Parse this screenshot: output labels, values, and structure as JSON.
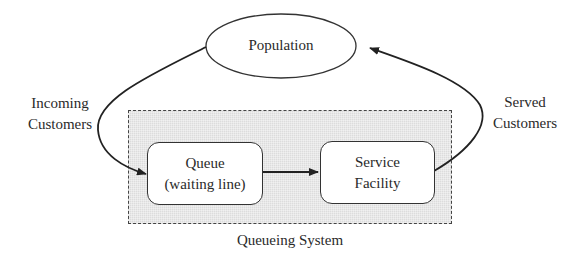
{
  "diagram": {
    "type": "flow",
    "nodes": {
      "population": {
        "label": "Population",
        "shape": "ellipse"
      },
      "queue": {
        "line1": "Queue",
        "line2": "(waiting line)",
        "shape": "rounded-rect"
      },
      "service": {
        "line1": "Service",
        "line2": "Facility",
        "shape": "rounded-rect"
      }
    },
    "group": {
      "label": "Queueing System",
      "style": "dashed shaded rectangle"
    },
    "edge_labels": {
      "incoming": {
        "line1": "Incoming",
        "line2": "Customers"
      },
      "served": {
        "line1": "Served",
        "line2": "Customers"
      }
    },
    "edges": [
      {
        "from": "population",
        "to": "queue",
        "label": "Incoming Customers"
      },
      {
        "from": "queue",
        "to": "service"
      },
      {
        "from": "service",
        "to": "population",
        "label": "Served Customers"
      }
    ],
    "colors": {
      "stroke": "#222222",
      "fill_group": "#dcdcdc",
      "background": "#ffffff"
    }
  }
}
